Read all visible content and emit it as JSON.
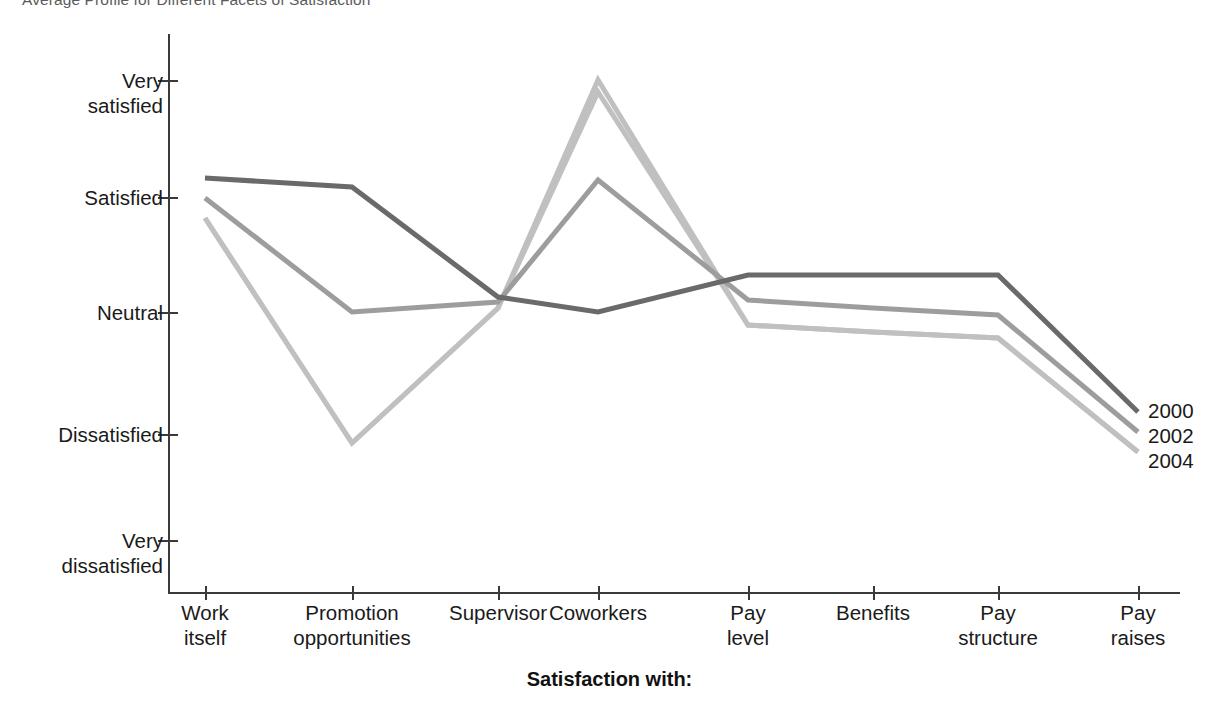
{
  "title": "Average Profile for Different Facets of Satisfaction",
  "axis_title": "Satisfaction with:",
  "legend_title": "",
  "colors": {
    "series_2000": "#6a6a6a",
    "series_2002": "#9d9d9d",
    "series_2004": "#c0c0c0",
    "axis": "#3a3a3a",
    "text": "#1a1a1a",
    "title_text": "#5b5b5b",
    "background": "#ffffff"
  },
  "legend": {
    "items": [
      {
        "label": "2000",
        "color": "#6a6a6a"
      },
      {
        "label": "2002",
        "color": "#9d9d9d"
      },
      {
        "label": "2004",
        "color": "#c0c0c0"
      }
    ]
  },
  "y_axis": {
    "labels": [
      "Very\nsatisfied",
      "Satisfied",
      "Neutral",
      "Dissatisfied",
      "Very\ndissatisfied"
    ],
    "values": [
      5,
      4,
      3,
      2,
      1
    ],
    "pixels": [
      80,
      197,
      312,
      434,
      540
    ]
  },
  "x_axis": {
    "labels": [
      "Work\nitself",
      "Promotion\nopportunities",
      "Supervisor",
      "Coworkers",
      "Pay\nlevel",
      "Benefits",
      "Pay\nstructure",
      "Pay\nraises"
    ],
    "pixels": [
      205,
      352,
      498,
      598,
      748,
      873,
      998,
      1138
    ]
  },
  "chart_data": {
    "type": "line",
    "title": "Average Profile for Different Facets of Satisfaction",
    "xlabel": "Satisfaction with:",
    "ylabel": "",
    "categories": [
      "Work itself",
      "Promotion opportunities",
      "Supervisor",
      "Coworkers",
      "Pay level",
      "Benefits",
      "Pay structure",
      "Pay raises"
    ],
    "ytick_labels": [
      "Very dissatisfied",
      "Dissatisfied",
      "Neutral",
      "Satisfied",
      "Very satisfied"
    ],
    "ytick_values": [
      1,
      2,
      3,
      4,
      5
    ],
    "ylim": [
      1,
      5
    ],
    "grid": false,
    "legend_position": "right-inline-end-of-line",
    "series": [
      {
        "name": "2000",
        "color": "#6a6a6a",
        "values": [
          4.05,
          4.0,
          3.12,
          2.97,
          3.3,
          3.3,
          3.3,
          2.0
        ],
        "pixel_points": [
          [
            205,
            178
          ],
          [
            352,
            187
          ],
          [
            498,
            297
          ],
          [
            598,
            312
          ],
          [
            748,
            275
          ],
          [
            873,
            275
          ],
          [
            998,
            275
          ],
          [
            1138,
            412
          ]
        ]
      },
      {
        "name": "2002",
        "color": "#9d9d9d",
        "values": [
          3.88,
          3.0,
          3.07,
          4.07,
          3.1,
          3.0,
          2.97,
          1.84
        ],
        "pixel_points": [
          [
            205,
            198
          ],
          [
            352,
            312
          ],
          [
            498,
            302
          ],
          [
            598,
            180
          ],
          [
            748,
            300
          ],
          [
            873,
            308
          ],
          [
            998,
            315
          ],
          [
            1138,
            432
          ]
        ]
      },
      {
        "name": "2004",
        "color": "#c0c0c0",
        "values": [
          3.72,
          1.9,
          3.0,
          5.0,
          2.9,
          2.85,
          2.78,
          1.67
        ],
        "pixel_points": [
          [
            205,
            218
          ],
          [
            352,
            443
          ],
          [
            498,
            308
          ],
          [
            598,
            80
          ],
          [
            748,
            325
          ],
          [
            873,
            332
          ],
          [
            998,
            338
          ],
          [
            1138,
            452
          ]
        ]
      },
      {
        "name": "2004-upper-shadow",
        "color": "#c0c0c0",
        "values": [
          3.72,
          1.9,
          3.0,
          4.88,
          2.9,
          2.85,
          2.78,
          1.67
        ],
        "pixel_points": [
          [
            205,
            218
          ],
          [
            352,
            443
          ],
          [
            498,
            308
          ],
          [
            598,
            92
          ],
          [
            748,
            325
          ],
          [
            873,
            332
          ],
          [
            998,
            338
          ],
          [
            1138,
            452
          ]
        ]
      }
    ]
  }
}
